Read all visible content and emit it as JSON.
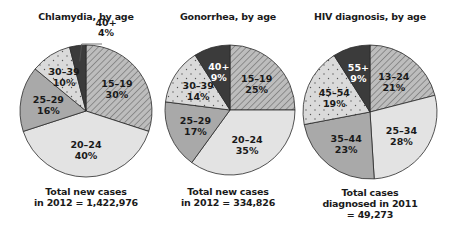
{
  "chart_data": [
    {
      "type": "pie",
      "title": "Chlamydia, by age",
      "categories": [
        "15–19",
        "20–24",
        "25–29",
        "30–39",
        "40+"
      ],
      "values": [
        30,
        40,
        16,
        10,
        4
      ],
      "labels": [
        "15–19\n30%",
        "20–24\n40%",
        "25–29\n16%",
        "30–39\n10%",
        "40+\n4%"
      ],
      "annotation": [
        "Total new cases",
        "in 2012 = 1,422,976"
      ],
      "start_angle": "12 o'clock, clockwise"
    },
    {
      "type": "pie",
      "title": "Gonorrhea, by age",
      "categories": [
        "15–19",
        "20–24",
        "25–29",
        "30–39",
        "40+"
      ],
      "values": [
        25,
        35,
        17,
        14,
        9
      ],
      "labels": [
        "15–19\n25%",
        "20–24\n35%",
        "25–29\n17%",
        "30–39\n14%",
        "40+\n9%"
      ],
      "annotation": [
        "Total new cases",
        "in 2012 = 334,826"
      ],
      "start_angle": "12 o'clock, clockwise"
    },
    {
      "type": "pie",
      "title": "HIV diagnosis, by age",
      "categories": [
        "13–24",
        "25–34",
        "35–44",
        "45–54",
        "55+"
      ],
      "values": [
        21,
        28,
        23,
        19,
        9
      ],
      "labels": [
        "13–24\n21%",
        "25–34\n28%",
        "35–44\n23%",
        "45–54\n19%",
        "55+\n9%"
      ],
      "annotation": [
        "Total cases",
        "diagnosed in 2011",
        "= 49,273"
      ],
      "start_angle": "12 o'clock, clockwise"
    }
  ],
  "charts": [
    {
      "title": "Chlamydia, by age",
      "caption": [
        "Total new cases",
        "in 2012 = 1,422,976"
      ],
      "slices": [
        {
          "range": "15–19",
          "pct": 30,
          "pct_label": "30%",
          "fill": "hatch"
        },
        {
          "range": "20–24",
          "pct": 40,
          "pct_label": "40%",
          "fill": "light"
        },
        {
          "range": "25–29",
          "pct": 16,
          "pct_label": "16%",
          "fill": "medium"
        },
        {
          "range": "30–39",
          "pct": 10,
          "pct_label": "10%",
          "fill": "dots"
        },
        {
          "range": "40+",
          "pct": 4,
          "pct_label": "4%",
          "fill": "dark",
          "callout": true
        }
      ]
    },
    {
      "title": "Gonorrhea, by age",
      "caption": [
        "Total new cases",
        "in 2012 = 334,826"
      ],
      "slices": [
        {
          "range": "15–19",
          "pct": 25,
          "pct_label": "25%",
          "fill": "hatch"
        },
        {
          "range": "20–24",
          "pct": 35,
          "pct_label": "35%",
          "fill": "light"
        },
        {
          "range": "25–29",
          "pct": 17,
          "pct_label": "17%",
          "fill": "medium"
        },
        {
          "range": "30–39",
          "pct": 14,
          "pct_label": "14%",
          "fill": "dots"
        },
        {
          "range": "40+",
          "pct": 9,
          "pct_label": "9%",
          "fill": "dark"
        }
      ]
    },
    {
      "title": "HIV diagnosis, by age",
      "caption": [
        "Total cases",
        "diagnosed in 2011",
        "= 49,273"
      ],
      "slices": [
        {
          "range": "13–24",
          "pct": 21,
          "pct_label": "21%",
          "fill": "hatch"
        },
        {
          "range": "25–34",
          "pct": 28,
          "pct_label": "28%",
          "fill": "light"
        },
        {
          "range": "35–44",
          "pct": 23,
          "pct_label": "23%",
          "fill": "medium"
        },
        {
          "range": "45–54",
          "pct": 19,
          "pct_label": "19%",
          "fill": "dots"
        },
        {
          "range": "55+",
          "pct": 9,
          "pct_label": "9%",
          "fill": "dark"
        }
      ]
    }
  ],
  "colors": {
    "hatch_bg": "#bdbdbd",
    "hatch_line": "#6a6a6a",
    "light": "#e3e3e3",
    "medium": "#a9a9a9",
    "dots_bg": "#dadada",
    "dots_dot": "#555555",
    "dark": "#3b3b3b",
    "outline": "#2a2a2a",
    "text": "#1a1a1a",
    "text_on_dark": "#ffffff"
  }
}
